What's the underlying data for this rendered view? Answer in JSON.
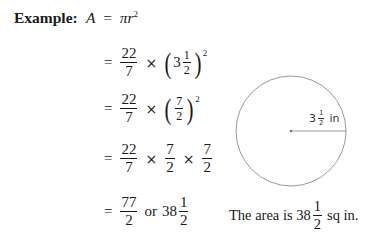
{
  "label": "Example:",
  "formula": {
    "lhs": "A",
    "eq": "=",
    "pi": "π",
    "r": "r",
    "exp": "2"
  },
  "steps": [
    {
      "eq": "=",
      "frac_num": "22",
      "frac_den": "7",
      "times": "×",
      "whole": "3",
      "inner_num": "1",
      "inner_den": "2",
      "exp": "2"
    },
    {
      "eq": "=",
      "frac_num": "22",
      "frac_den": "7",
      "times": "×",
      "inner_num": "7",
      "inner_den": "2",
      "exp": "2"
    },
    {
      "eq": "=",
      "frac_num": "22",
      "frac_den": "7",
      "times": "×",
      "f2_num": "7",
      "f2_den": "2",
      "f3_num": "7",
      "f3_den": "2"
    },
    {
      "eq": "=",
      "frac_num": "77",
      "frac_den": "2",
      "or": "or",
      "whole": "38",
      "mixed_num": "1",
      "mixed_den": "2"
    }
  ],
  "diagram": {
    "radius_label_whole": "3",
    "radius_label_num": "1",
    "radius_label_den": "2",
    "radius_label_unit": "in",
    "stroke_color": "#9a9a9a"
  },
  "caption": {
    "prefix": "The area is ",
    "whole": "38",
    "num": "1",
    "den": "2",
    "suffix": "sq in."
  }
}
